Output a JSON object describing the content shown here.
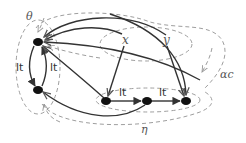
{
  "diagram": {
    "title": "",
    "colors": {
      "solid_edge": "#333333",
      "dashed_edge": "#999999",
      "node": "#111111",
      "label": "#555555"
    },
    "nodes": [
      {
        "id": "a",
        "label": "",
        "x": 38,
        "y": 42
      },
      {
        "id": "b",
        "label": "",
        "x": 38,
        "y": 90
      },
      {
        "id": "c",
        "label": "",
        "x": 106,
        "y": 101
      },
      {
        "id": "d",
        "label": "",
        "x": 147,
        "y": 101
      },
      {
        "id": "e",
        "label": "",
        "x": 186,
        "y": 101
      }
    ],
    "variables": [
      {
        "id": "x",
        "label": "x",
        "x": 126,
        "y": 40
      },
      {
        "id": "y",
        "label": "y",
        "x": 166,
        "y": 40
      }
    ],
    "edge_labels": {
      "a_to_b": "lt",
      "b_to_a": "lt",
      "c_to_d": "lt",
      "d_to_e": "lt"
    },
    "region_labels": {
      "theta": "θ",
      "alpha_c": "αc",
      "eta": "η"
    }
  }
}
